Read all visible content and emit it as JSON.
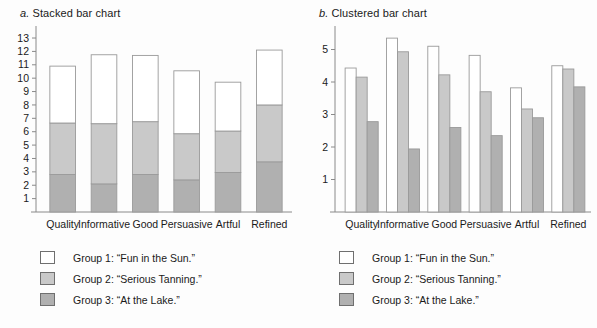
{
  "figure": {
    "background": "#fdfdfd",
    "axis_color": "#8a8a8a"
  },
  "panels": [
    {
      "key": "stacked",
      "letter": "a.",
      "title": "Stacked bar chart"
    },
    {
      "key": "clustered",
      "letter": "b.",
      "title": "Clustered bar chart"
    }
  ],
  "legend": {
    "items": [
      {
        "label": "Group 1: “Fun in the Sun.”",
        "color": "#ffffff"
      },
      {
        "label": "Group 2: “Serious Tanning.”",
        "color": "#c9c9c9"
      },
      {
        "label": "Group 3: “At the Lake.”",
        "color": "#b0b0b0"
      }
    ]
  },
  "chart_data": [
    {
      "type": "bar",
      "subtype": "stacked",
      "title": "a. Stacked bar chart",
      "xlabel": "",
      "ylabel": "",
      "ylim": [
        0,
        13.6
      ],
      "yticks": [
        1,
        2,
        3,
        4,
        5,
        6,
        7,
        8,
        9,
        10,
        11,
        12,
        13
      ],
      "grid": false,
      "legend_position": "below",
      "categories": [
        "Quality",
        "Informative",
        "Good",
        "Persuasive",
        "Artful",
        "Refined"
      ],
      "series": [
        {
          "name": "Group 3: “At the Lake.”",
          "color": "#b0b0b0",
          "values": [
            2.8,
            2.1,
            2.8,
            2.4,
            2.95,
            3.75
          ]
        },
        {
          "name": "Group 2: “Serious Tanning.”",
          "color": "#c9c9c9",
          "values": [
            3.85,
            4.5,
            3.95,
            3.45,
            3.1,
            4.25
          ]
        },
        {
          "name": "Group 1: “Fun in the Sun.”",
          "color": "#ffffff",
          "values": [
            4.25,
            5.15,
            4.95,
            4.7,
            3.65,
            4.1
          ]
        }
      ],
      "totals": [
        10.9,
        11.75,
        11.7,
        10.55,
        9.7,
        12.1
      ]
    },
    {
      "type": "bar",
      "subtype": "clustered",
      "title": "b. Clustered bar chart",
      "xlabel": "",
      "ylabel": "",
      "ylim": [
        0,
        5.6
      ],
      "yticks": [
        1,
        2,
        3,
        4,
        5
      ],
      "grid": false,
      "legend_position": "below",
      "categories": [
        "Quality",
        "Informative",
        "Good",
        "Persuasive",
        "Artful",
        "Refined"
      ],
      "series": [
        {
          "name": "Group 1: “Fun in the Sun.”",
          "color": "#ffffff",
          "values": [
            4.43,
            5.35,
            5.1,
            4.82,
            3.82,
            4.5
          ]
        },
        {
          "name": "Group 2: “Serious Tanning.”",
          "color": "#c9c9c9",
          "values": [
            4.15,
            4.93,
            4.22,
            3.7,
            3.17,
            4.4
          ]
        },
        {
          "name": "Group 3: “At the Lake.”",
          "color": "#b0b0b0",
          "values": [
            2.78,
            1.94,
            2.6,
            2.35,
            2.9,
            3.85
          ]
        }
      ]
    }
  ]
}
